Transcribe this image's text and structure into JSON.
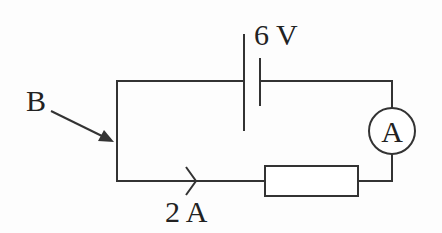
{
  "diagram": {
    "type": "circuit",
    "labels": {
      "battery_voltage": "6 V",
      "current": "2 A",
      "point_b": "B",
      "ammeter_symbol": "A"
    },
    "components": [
      {
        "kind": "cell",
        "label": "6 V"
      },
      {
        "kind": "ammeter",
        "label": "A"
      },
      {
        "kind": "resistor",
        "label": ""
      },
      {
        "kind": "current-arrow",
        "label": "2 A"
      },
      {
        "kind": "pointer",
        "label": "B"
      }
    ],
    "colors": {
      "line": "#333333",
      "background": "#fdfdfd"
    }
  }
}
